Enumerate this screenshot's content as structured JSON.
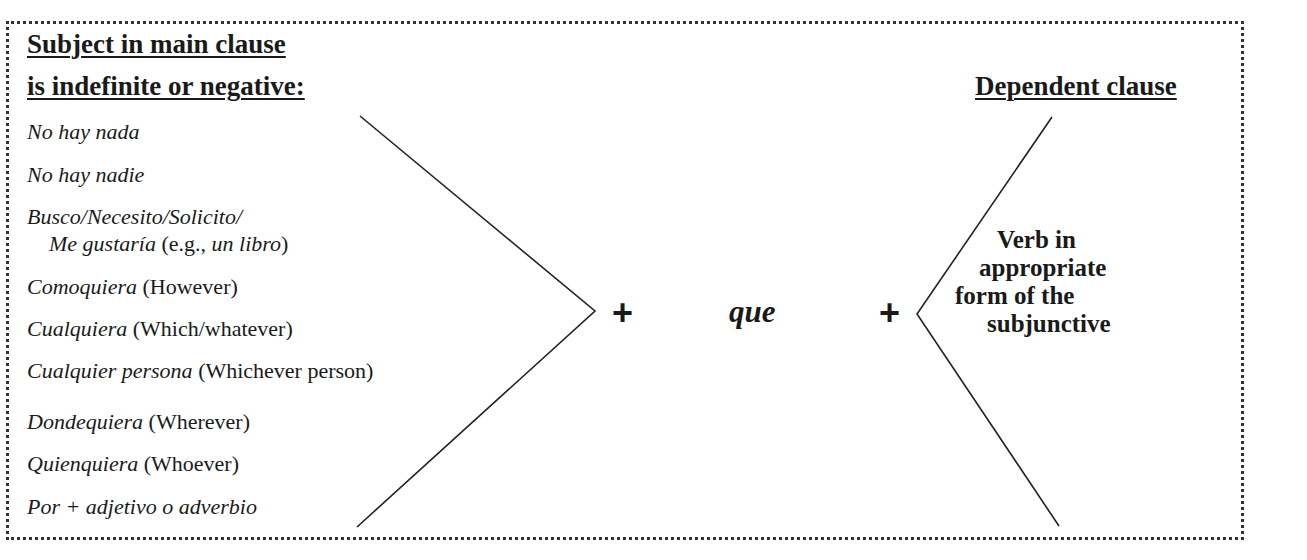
{
  "left_column": {
    "heading_line1": "Subject in main clause",
    "heading_line2": "is indefinite or negative:",
    "items": [
      {
        "italic": "No hay nada",
        "plain": ""
      },
      {
        "italic": "No hay nadie",
        "plain": ""
      },
      {
        "italic": "Busco/Necesito/Solicito/",
        "plain": ""
      },
      {
        "italic": "Me gustaría",
        "plain": " (e.g., ",
        "italic2": "un libro",
        "plain2": ")"
      },
      {
        "italic": "Comoquiera",
        "plain": " (However)"
      },
      {
        "italic": "Cualquiera",
        "plain": " (Which/whatever)"
      },
      {
        "italic": "Cualquier persona",
        "plain": " (Whichever person)"
      },
      {
        "italic": "Dondequiera",
        "plain": " (Wherever)"
      },
      {
        "italic": "Quienquiera",
        "plain": " (Whoever)"
      },
      {
        "italic": "Por + adjetivo o adverbio",
        "plain": ""
      }
    ]
  },
  "middle": {
    "plus1": "+",
    "connector": "que",
    "plus2": "+"
  },
  "right_column": {
    "heading": "Dependent clause",
    "verb_lines": [
      "Verb in",
      "appropriate",
      "form of the",
      "subjunctive"
    ]
  },
  "colors": {
    "text": "#1a1a1a",
    "border": "#333333",
    "background": "#ffffff"
  }
}
